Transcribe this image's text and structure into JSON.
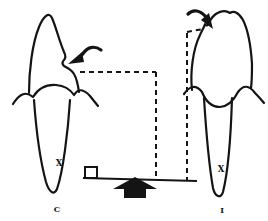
{
  "theme": {
    "ink": "#141414",
    "bg": "#ffffff"
  },
  "diagram": {
    "left_tooth": {
      "label": "C",
      "mark": "X"
    },
    "right_tooth": {
      "label": "I",
      "mark": "X"
    },
    "icons": {
      "left_force": "curved-arrow-icon",
      "right_force": "curved-arrow-icon",
      "fulcrum": "up-arrow-icon",
      "weight": "open-square-icon"
    }
  }
}
